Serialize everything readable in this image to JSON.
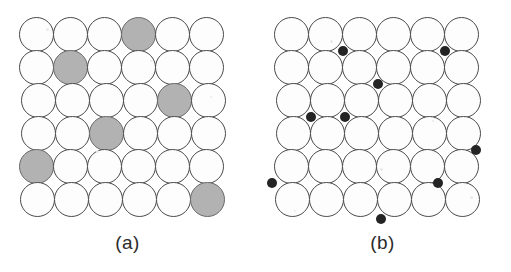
{
  "figure": {
    "kind": "two-panel-lattice-diagram",
    "background_color": "#ffffff",
    "panel_count": 2
  },
  "lattice_geometry": {
    "rows": 6,
    "columns": 6,
    "circle_diameter_px": 35,
    "column_pitch_px": 34,
    "row_pitch_px": 33,
    "origin_x_px": 19,
    "origin_y_px": 17,
    "row_x_offsets_px": [
      0,
      0,
      2,
      2,
      0,
      1
    ]
  },
  "colors": {
    "atom_fill": "#fdfdfd",
    "atom_stroke": "#4a4a4a",
    "substitutional_fill": "#b2b2b2",
    "substitutional_stroke": "#6a6a6a",
    "interstitial_fill": "#242424",
    "caption_text": "#2b2b2b"
  },
  "panel_a": {
    "caption": "(a)",
    "defect_type": "substitutional",
    "defect_label": "shaded substitutional atom",
    "total_atoms": 36,
    "defect_count": 6,
    "defects": [
      {
        "row": 1,
        "col": 4
      },
      {
        "row": 2,
        "col": 2
      },
      {
        "row": 3,
        "col": 5
      },
      {
        "row": 4,
        "col": 3
      },
      {
        "row": 5,
        "col": 1
      },
      {
        "row": 6,
        "col": 6
      }
    ]
  },
  "panel_b": {
    "caption": "(b)",
    "defect_type": "interstitial",
    "defect_label": "small interstitial atom",
    "total_atoms": 36,
    "defect_count": 8,
    "dot_diameter_px": 10,
    "defects": [
      {
        "row_boundary": 1.5,
        "col_boundary": 2.5
      },
      {
        "row_boundary": 1.5,
        "col_boundary": 5.5
      },
      {
        "row_boundary": 2.5,
        "col_boundary": 3.5
      },
      {
        "row_boundary": 3.5,
        "col_boundary": 1.5
      },
      {
        "row_boundary": 3.5,
        "col_boundary": 2.5
      },
      {
        "row_boundary": 4.5,
        "col_boundary": 6.4
      },
      {
        "row_boundary": 5.5,
        "col_boundary": 0.4
      },
      {
        "row_boundary": 5.5,
        "col_boundary": 5.3
      },
      {
        "row_boundary": 6.6,
        "col_boundary": 3.6
      }
    ]
  },
  "speckles": [
    {
      "x": 46,
      "y": 28,
      "d": 3
    },
    {
      "x": 150,
      "y": 60,
      "d": 2
    },
    {
      "x": 96,
      "y": 150,
      "d": 3
    },
    {
      "x": 210,
      "y": 96,
      "d": 2
    },
    {
      "x": 330,
      "y": 40,
      "d": 3
    },
    {
      "x": 432,
      "y": 120,
      "d": 2
    },
    {
      "x": 470,
      "y": 196,
      "d": 3
    },
    {
      "x": 294,
      "y": 210,
      "d": 2
    },
    {
      "x": 380,
      "y": 168,
      "d": 3
    }
  ]
}
